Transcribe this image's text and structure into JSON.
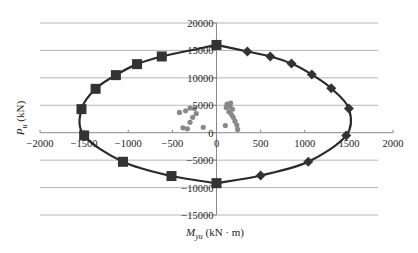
{
  "chart_data": {
    "type": "scatter",
    "title": "",
    "xlabel": "M_yu (kN · m)",
    "ylabel": "P_u (kN)",
    "xlabel_parts": {
      "main": "M",
      "sub": "yu",
      "unit": " (kN · m)"
    },
    "ylabel_parts": {
      "main": "P",
      "sub": "u",
      "unit": " (kN)"
    },
    "xlim": [
      -2000,
      2000
    ],
    "ylim": [
      -15000,
      20000
    ],
    "x_ticks": [
      -2000,
      -1500,
      -1000,
      -500,
      0,
      500,
      1000,
      1500,
      2000
    ],
    "y_ticks": [
      -15000,
      -10000,
      -5000,
      0,
      5000,
      10000,
      15000,
      20000
    ],
    "grid": {
      "horizontal": true,
      "vertical": false
    },
    "legend": null,
    "series": [
      {
        "name": "interaction-curve-left",
        "marker": "square",
        "color": "#333333",
        "line": true,
        "points": [
          [
            0,
            16000
          ],
          [
            -620,
            13900
          ],
          [
            -900,
            12500
          ],
          [
            -1140,
            10500
          ],
          [
            -1370,
            8000
          ],
          [
            -1530,
            4300
          ],
          [
            -1500,
            -500
          ],
          [
            -1060,
            -5300
          ],
          [
            -510,
            -7900
          ],
          [
            0,
            -9200
          ]
        ]
      },
      {
        "name": "interaction-curve-right",
        "marker": "diamond",
        "color": "#333333",
        "line": true,
        "points": [
          [
            0,
            16000
          ],
          [
            350,
            14800
          ],
          [
            610,
            13900
          ],
          [
            850,
            12600
          ],
          [
            1080,
            10600
          ],
          [
            1300,
            8100
          ],
          [
            1500,
            4400
          ],
          [
            1470,
            -500
          ],
          [
            1040,
            -5300
          ],
          [
            500,
            -7800
          ],
          [
            0,
            -9200
          ]
        ]
      },
      {
        "name": "demand-points",
        "marker": "circle",
        "color": "#888888",
        "line": false,
        "points": [
          [
            -350,
            4000
          ],
          [
            -300,
            4500
          ],
          [
            -250,
            4400
          ],
          [
            -230,
            3500
          ],
          [
            -270,
            2800
          ],
          [
            -300,
            1900
          ],
          [
            -380,
            900
          ],
          [
            -330,
            700
          ],
          [
            -150,
            1000
          ],
          [
            -420,
            3700
          ],
          [
            120,
            5200
          ],
          [
            150,
            4800
          ],
          [
            180,
            4300
          ],
          [
            140,
            3800
          ],
          [
            170,
            3300
          ],
          [
            190,
            2800
          ],
          [
            210,
            2100
          ],
          [
            230,
            1400
          ],
          [
            100,
            1300
          ],
          [
            240,
            600
          ],
          [
            110,
            4600
          ],
          [
            160,
            5400
          ]
        ]
      }
    ]
  }
}
